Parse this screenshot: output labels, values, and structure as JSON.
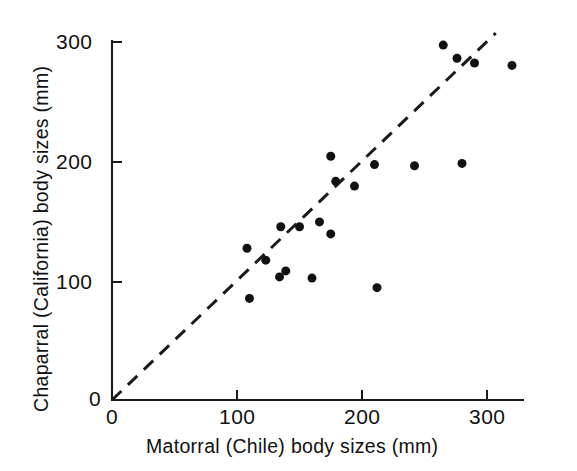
{
  "chart_data": {
    "type": "scatter",
    "title": "",
    "xlabel": "Matorral (Chile) body sizes (mm)",
    "ylabel": "Chaparral (California) body sizes (mm)",
    "xlim": [
      0,
      330
    ],
    "ylim": [
      0,
      320
    ],
    "xticks": [
      0,
      100,
      200,
      300
    ],
    "yticks": [
      0,
      100,
      200,
      300
    ],
    "xtick_labels": [
      "0",
      "100",
      "200",
      "300"
    ],
    "ytick_labels": [
      "0",
      "100",
      "200",
      "300"
    ],
    "grid": false,
    "legend": null,
    "marker_color": "#111111",
    "marker_size": 9,
    "points": [
      {
        "x": 108,
        "y": 127
      },
      {
        "x": 110,
        "y": 85
      },
      {
        "x": 123,
        "y": 117
      },
      {
        "x": 134,
        "y": 103
      },
      {
        "x": 139,
        "y": 108
      },
      {
        "x": 160,
        "y": 102
      },
      {
        "x": 135,
        "y": 145
      },
      {
        "x": 150,
        "y": 145
      },
      {
        "x": 166,
        "y": 149
      },
      {
        "x": 175,
        "y": 139
      },
      {
        "x": 175,
        "y": 204
      },
      {
        "x": 179,
        "y": 183
      },
      {
        "x": 194,
        "y": 179
      },
      {
        "x": 210,
        "y": 197
      },
      {
        "x": 212,
        "y": 94
      },
      {
        "x": 242,
        "y": 196
      },
      {
        "x": 280,
        "y": 198
      },
      {
        "x": 265,
        "y": 297
      },
      {
        "x": 276,
        "y": 286
      },
      {
        "x": 290,
        "y": 282
      },
      {
        "x": 320,
        "y": 280
      }
    ],
    "reference_line": {
      "type": "dashed",
      "description": "1:1 line",
      "x0": 0,
      "y0": 0,
      "x1": 307,
      "y1": 307
    }
  },
  "axis": {
    "x_tick_0": "0",
    "x_tick_1": "100",
    "x_tick_2": "200",
    "x_tick_3": "300",
    "y_tick_0": "0",
    "y_tick_1": "100",
    "y_tick_2": "200",
    "y_tick_3": "300",
    "x_title": "Matorral (Chile) body sizes (mm)",
    "y_title": "Chaparral (California) body sizes (mm)"
  }
}
